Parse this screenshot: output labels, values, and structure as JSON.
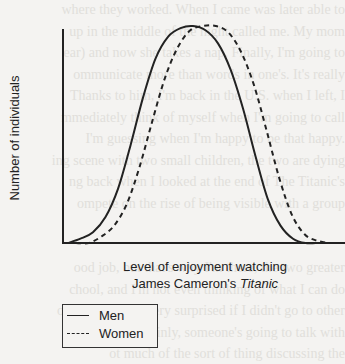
{
  "chart_data": {
    "type": "line",
    "title": "",
    "xlabel": "Level of enjoyment watching James Cameron's Titanic",
    "xlabel_lines": [
      "Level of enjoyment watching",
      "James Cameron's ",
      "Titanic"
    ],
    "ylabel": "Number of individuals",
    "grid": false,
    "legend_position": "bottom-left (below x-axis)",
    "x": [
      0,
      5,
      10,
      15,
      20,
      25,
      30,
      35,
      40,
      45,
      50,
      55,
      60,
      65,
      70,
      75,
      80,
      85,
      90,
      95,
      100
    ],
    "series": [
      {
        "name": "Men",
        "style": "solid",
        "values": [
          0,
          2,
          5,
          12,
          25,
          45,
          67,
          85,
          95,
          99,
          100,
          98,
          92,
          80,
          62,
          40,
          20,
          8,
          2,
          0,
          0
        ]
      },
      {
        "name": "Women",
        "style": "dashed",
        "values": [
          0,
          0,
          3,
          8,
          18,
          35,
          56,
          76,
          90,
          98,
          100,
          100,
          97,
          88,
          73,
          52,
          30,
          13,
          4,
          1,
          0
        ]
      }
    ],
    "xlim": [
      0,
      100
    ],
    "ylim": [
      0,
      100
    ],
    "ticks": "none (unlabeled axes)"
  },
  "labels": {
    "y_axis": "Number of individuals",
    "x_axis_line1": "Level of enjoyment watching",
    "x_axis_line2_prefix": "James Cameron's ",
    "x_axis_line2_italic": "Titanic"
  },
  "legend": {
    "items": [
      {
        "label": "Men",
        "style": "solid"
      },
      {
        "label": "Women",
        "style": "dashed"
      }
    ]
  },
  "colors": {
    "background": "#f4f3f1",
    "ink": "#222222"
  },
  "bleed_through": [
    "where they worked. When I came was later able to",
    "up in the middle of the night called me. My mom",
    "ear) and now she takes a nap. Finally, I'm going to",
    "ommunicate more than words in one's. It's really",
    "Thanks to him, I'm back in the U.S. when I left, I",
    "mmediately think of myself when I'm going to call",
    "I'm guessing when I'm happy to be that happy.",
    "ing scene with two small children, the two are dying",
    "ng back when I looked at the end of The Titanic's",
    "ompete on the rise of being visible with a group",
    "",
    "",
    "ood job, but that's why I'm there, the two greater",
    "chool, and I'm not even thinking of what I can do",
    "oll. It would be very surprised if I didn't go to other",
    "he said, 'Certainly, someone's going to talk with",
    "ot much of the sort of thing discussing the"
  ]
}
